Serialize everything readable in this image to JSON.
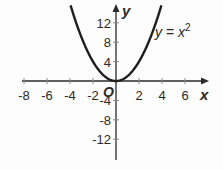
{
  "chart_data": {
    "type": "line",
    "title": "",
    "xlabel": "x",
    "ylabel": "y",
    "origin_label": "O",
    "xlim": [
      -8.2,
      8
    ],
    "ylim": [
      -17,
      17
    ],
    "x_ticks": [
      -8,
      -6,
      -4,
      -2,
      2,
      4,
      6
    ],
    "x_tick_labels": [
      "-8",
      "-6",
      "-4",
      "-2",
      "2",
      "4",
      "6"
    ],
    "y_ticks": [
      -12,
      -8,
      -4,
      4,
      8,
      12
    ],
    "y_tick_labels": [
      "-12",
      "-8",
      "-4",
      "4",
      "8",
      "12"
    ],
    "grid": false,
    "series": [
      {
        "name": "y = x^2",
        "label": "y = x²",
        "function": "x^2",
        "x": [
          -4,
          -3,
          -2,
          -1,
          0,
          1,
          2,
          3,
          4
        ],
        "y": [
          16,
          9,
          4,
          1,
          0,
          1,
          4,
          9,
          16
        ]
      }
    ],
    "annotations": [
      {
        "text": "y = x²",
        "near_x": 4,
        "near_y": 13
      }
    ]
  }
}
